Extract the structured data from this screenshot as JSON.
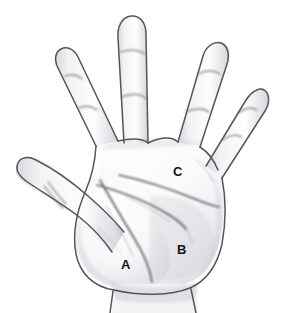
{
  "figure": {
    "medium": "pencil sketch line drawing",
    "view": "palmar (anterior) view of left hand",
    "background_color": "#ffffff",
    "outline_color": "#5a5a5f",
    "skin_fill_color": "#fbfbfb",
    "shading_color": "#c9c9ce",
    "label_color": "#141414",
    "width": 283,
    "height": 313
  },
  "labels": [
    {
      "id": "a",
      "text": "A",
      "region": "thenar eminence",
      "x": 126,
      "y": 265
    },
    {
      "id": "b",
      "text": "B",
      "region": "hypothenar eminence",
      "x": 182,
      "y": 250
    },
    {
      "id": "c",
      "text": "C",
      "region": "distal palm metacarpal pad",
      "x": 178,
      "y": 172
    }
  ],
  "anatomy": {
    "digits": [
      {
        "name": "thumb",
        "creases": 1
      },
      {
        "name": "index-finger",
        "creases": 2
      },
      {
        "name": "middle-finger",
        "creases": 2
      },
      {
        "name": "ring-finger",
        "creases": 2
      },
      {
        "name": "little-finger",
        "creases": 2
      }
    ],
    "palm_creases": [
      "distal-transverse-crease",
      "proximal-transverse-crease",
      "thenar-crease"
    ],
    "wrist": "wrist crease at base"
  }
}
